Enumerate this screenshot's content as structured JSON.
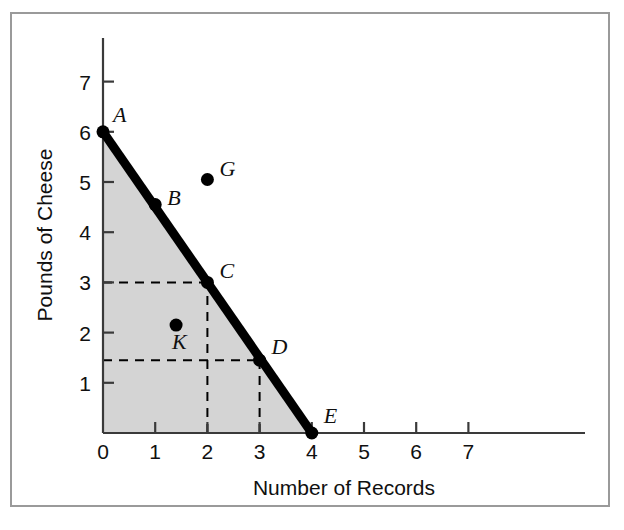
{
  "figure": {
    "background_color": "#ffffff",
    "border_color": "#9a9a9a",
    "axis_color": "#3a3a3a",
    "frontier_color": "#000000",
    "shaded_region_color": "#d4d4d4",
    "dashed_line_color": "#000000"
  },
  "chart_data": {
    "type": "line",
    "title": "",
    "subtitle": "",
    "xlabel": "Number of Records",
    "ylabel": "Pounds of Cheese",
    "xlim": [
      0,
      7.6
    ],
    "ylim": [
      0,
      7.6
    ],
    "xticks": [
      0,
      1,
      2,
      3,
      4,
      5,
      6,
      7
    ],
    "xticklabels": [
      "0",
      "1",
      "2",
      "3",
      "4",
      "5",
      "6",
      "7"
    ],
    "yticks": [
      1,
      2,
      3,
      4,
      5,
      6,
      7
    ],
    "yticklabels": [
      "1",
      "2",
      "3",
      "4",
      "5",
      "6",
      "7"
    ],
    "grid": false,
    "legend": "none",
    "series": [
      {
        "name": "Production Possibilities Frontier",
        "type": "line",
        "style": "thick-solid",
        "x": [
          0,
          4
        ],
        "y": [
          6,
          0
        ]
      }
    ],
    "points": [
      {
        "label": "A",
        "x": 0,
        "y": 6,
        "on_frontier": true,
        "label_dx": 10,
        "label_dy": -10
      },
      {
        "label": "B",
        "x": 1,
        "y": 4.55,
        "on_frontier": true,
        "label_dx": 12,
        "label_dy": 0
      },
      {
        "label": "C",
        "x": 2,
        "y": 3,
        "on_frontier": true,
        "label_dx": 12,
        "label_dy": -4
      },
      {
        "label": "D",
        "x": 3,
        "y": 1.45,
        "on_frontier": true,
        "label_dx": 12,
        "label_dy": -6
      },
      {
        "label": "E",
        "x": 4,
        "y": 0,
        "on_frontier": true,
        "label_dx": 12,
        "label_dy": -10
      },
      {
        "label": "G",
        "x": 2,
        "y": 5.05,
        "on_frontier": false,
        "label_dx": 12,
        "label_dy": -3
      },
      {
        "label": "K",
        "x": 1.4,
        "y": 2.15,
        "on_frontier": false,
        "label_dx": -4,
        "label_dy": 24
      }
    ],
    "dashed_guides": [
      {
        "from_label": "C",
        "axis": "y",
        "value": 3,
        "note": "horizontal dashed from y-axis to point C"
      },
      {
        "from_label": "C",
        "axis": "x",
        "value": 2,
        "note": "vertical dashed from x-axis to point C"
      },
      {
        "from_label": "D",
        "axis": "y",
        "value": 1.45,
        "note": "horizontal dashed from y-axis to point D"
      },
      {
        "from_label": "D",
        "axis": "x",
        "value": 3,
        "note": "vertical dashed from x-axis to point D"
      }
    ],
    "shaded_region": {
      "description": "Attainable production region below the frontier",
      "vertices": [
        [
          0,
          0
        ],
        [
          0,
          6
        ],
        [
          4,
          0
        ]
      ]
    }
  }
}
